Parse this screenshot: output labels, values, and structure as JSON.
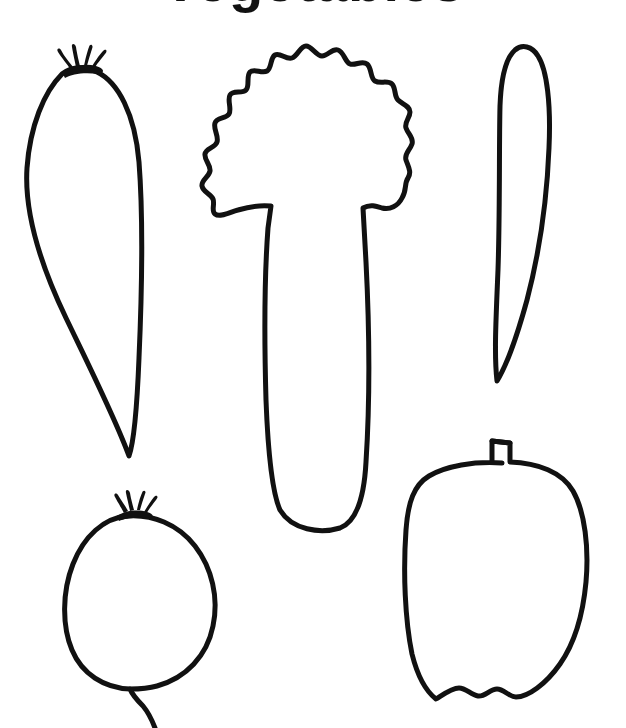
{
  "page": {
    "kind": "line-art-coloring-sheet",
    "width": 626,
    "height": 728,
    "background_color": "#ffffff",
    "ink_color": "#111111",
    "stroke_width": 5
  },
  "header": {
    "clipped_caption": "Vegetables",
    "note": "Only the bottom descender marks of the heading are visible at the top edge"
  },
  "figures": [
    {
      "id": "carrot",
      "label": "Carrot",
      "position": "upper-left",
      "has_leaf_crown": true,
      "bbox": {
        "x": 24,
        "y": 48,
        "w": 120,
        "h": 412
      }
    },
    {
      "id": "broccoli",
      "label": "Broccoli",
      "position": "upper-center",
      "has_leaf_crown": false,
      "bbox": {
        "x": 198,
        "y": 14,
        "w": 216,
        "h": 518
      }
    },
    {
      "id": "chili-pepper",
      "label": "Chili Pepper",
      "position": "upper-right",
      "has_leaf_crown": false,
      "bbox": {
        "x": 490,
        "y": 40,
        "w": 62,
        "h": 344
      }
    },
    {
      "id": "radish",
      "label": "Radish",
      "position": "lower-left",
      "has_leaf_crown": true,
      "bbox": {
        "x": 62,
        "y": 492,
        "w": 160,
        "h": 236
      }
    },
    {
      "id": "bell-pepper",
      "label": "Bell Pepper",
      "position": "lower-right",
      "has_leaf_crown": false,
      "bbox": {
        "x": 404,
        "y": 428,
        "w": 190,
        "h": 272
      }
    }
  ]
}
